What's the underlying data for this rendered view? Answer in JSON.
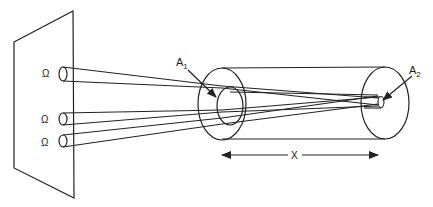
{
  "diagram": {
    "labels": {
      "omega_1": "Ω",
      "omega_2": "Ω",
      "omega_3": "Ω",
      "a1_main": "A",
      "a1_sub": "1",
      "a2_main": "A",
      "a2_sub": "2",
      "distance": "X"
    },
    "colors": {
      "stroke": "#222222",
      "background": "#ffffff"
    }
  }
}
